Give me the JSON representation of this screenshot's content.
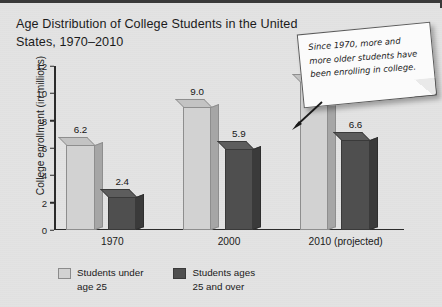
{
  "title": "Age Distribution of College Students in the\nUnited States, 1970–2010",
  "note": {
    "text": "Since 1970, more and more older students have been enrolling in college.",
    "arrow_icon": "arrow-down-left-icon"
  },
  "chart_data": {
    "type": "bar",
    "title": "Age Distribution of College Students in the United States, 1970–2010",
    "categories": [
      "1970",
      "2000",
      "2010 (projected)"
    ],
    "series": [
      {
        "name": "Students under\nage 25",
        "legend_label": "Students under\nage 25",
        "color": "#d2d2d2",
        "values": [
          6.2,
          9.0,
          10.8
        ],
        "labels": [
          "6.2",
          "9.0",
          "10.8"
        ]
      },
      {
        "name": "Students ages\n25 and over",
        "legend_label": "Students ages\n25 and over",
        "color": "#4f4f4f",
        "values": [
          2.4,
          5.9,
          6.6
        ],
        "labels": [
          "2.4",
          "5.9",
          "6.6"
        ]
      }
    ],
    "xlabel": "",
    "ylabel": "College enrollment (in millions)",
    "ylim": [
      0,
      12
    ],
    "yticks": [
      0,
      2,
      4,
      6,
      8,
      10,
      12
    ],
    "ytick_labels": [
      "0",
      "2",
      "4",
      "6",
      "8",
      "10",
      "12"
    ],
    "grid": false,
    "legend_position": "bottom"
  }
}
